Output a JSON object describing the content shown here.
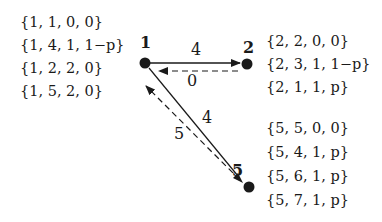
{
  "diagram": {
    "colors": {
      "stroke": "#1a1a1a",
      "node": "#1a1a1a",
      "background": "#ffffff"
    },
    "nodes": [
      {
        "id": "1",
        "label": "1",
        "sets": [
          "{1, 1, 0, 0}",
          "{1, 4, 1, 1−p}",
          "{1, 2, 2, 0}",
          "{1, 5, 2, 0}"
        ]
      },
      {
        "id": "2",
        "label": "2",
        "sets": [
          "{2, 2, 0, 0}",
          "{2, 3, 1, 1−p}",
          "{2, 1, 1, p}"
        ]
      },
      {
        "id": "5",
        "label": "5",
        "sets": [
          "{5, 5, 0, 0}",
          "{5, 4, 1, p}",
          "{5, 6, 1, p}",
          "{5, 7, 1, p}"
        ]
      }
    ],
    "edges": [
      {
        "from": "1",
        "to": "2",
        "style": "solid",
        "label": "4"
      },
      {
        "from": "2",
        "to": "1",
        "style": "dashed",
        "label": "0"
      },
      {
        "from": "1",
        "to": "5",
        "style": "solid",
        "label": "4"
      },
      {
        "from": "5",
        "to": "1",
        "style": "dashed",
        "label": "5"
      }
    ]
  }
}
